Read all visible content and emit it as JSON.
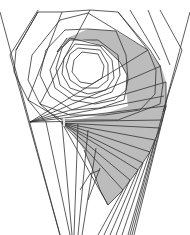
{
  "figure": {
    "title": "",
    "colors": {
      "background": "#ffffff",
      "stroke": "#2a2a2a",
      "shade": "#b9b9b9"
    }
  }
}
